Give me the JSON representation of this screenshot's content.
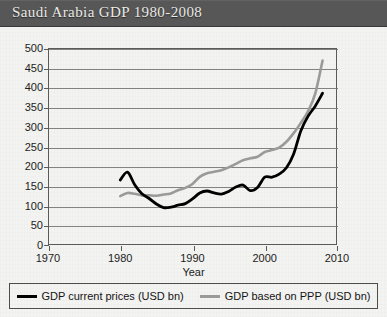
{
  "title": "Saudi Arabia GDP 1980-2008",
  "axis": {
    "x_title": "Year",
    "x_ticks": [
      "1970",
      "1980",
      "1990",
      "2000",
      "2010"
    ],
    "y_ticks": [
      "500",
      "450",
      "400",
      "350",
      "300",
      "250",
      "200",
      "150",
      "100",
      "50",
      "0"
    ]
  },
  "legend": {
    "items": [
      {
        "label": "GDP current prices (USD bn)",
        "color": "#000000",
        "swatch": "dark"
      },
      {
        "label": "GDP based on PPP (USD bn)",
        "color": "#9a9a9a",
        "swatch": "gray"
      }
    ]
  },
  "colors": {
    "banner": "#575757",
    "title_text": "#eceae6",
    "series_current": "#000000",
    "series_ppp": "#9a9a9a",
    "grid": "#6e6e6e",
    "frame": "#5a5a5a",
    "background": "#f3f3f1"
  },
  "chart_data": {
    "type": "line",
    "title": "Saudi Arabia GDP 1980-2008",
    "xlabel": "Year",
    "ylabel": "",
    "xlim": [
      1970,
      2010
    ],
    "ylim": [
      0,
      500
    ],
    "xtick_step": 10,
    "ytick_step": 50,
    "grid": true,
    "legend_position": "bottom",
    "x": [
      1980,
      1981,
      1982,
      1983,
      1984,
      1985,
      1986,
      1987,
      1988,
      1989,
      1990,
      1991,
      1992,
      1993,
      1994,
      1995,
      1996,
      1997,
      1998,
      1999,
      2000,
      2001,
      2002,
      2003,
      2004,
      2005,
      2006,
      2007,
      2008
    ],
    "series": [
      {
        "name": "GDP current prices (USD bn)",
        "color": "#000000",
        "values": [
          165,
          185,
          153,
          130,
          118,
          104,
          95,
          96,
          101,
          105,
          117,
          132,
          137,
          132,
          129,
          136,
          147,
          152,
          138,
          146,
          172,
          172,
          180,
          196,
          231,
          290,
          327,
          353,
          385
        ]
      },
      {
        "name": "GDP based on PPP (USD bn)",
        "color": "#9a9a9a",
        "values": [
          124,
          132,
          130,
          126,
          126,
          125,
          128,
          131,
          139,
          145,
          155,
          173,
          182,
          186,
          190,
          197,
          206,
          215,
          220,
          224,
          236,
          241,
          247,
          262,
          284,
          310,
          340,
          385,
          468
        ]
      }
    ]
  }
}
